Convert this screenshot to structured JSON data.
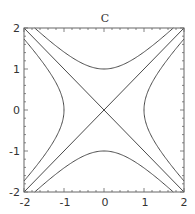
{
  "chart_data": {
    "type": "line",
    "subtype": "contour",
    "title": "C",
    "xlabel": "",
    "ylabel": "",
    "xlim": [
      -2,
      2
    ],
    "ylim": [
      -2,
      2
    ],
    "xticks": [
      -2,
      -1,
      0,
      1,
      2
    ],
    "yticks": [
      -2,
      -1,
      0,
      1,
      2
    ],
    "xtick_labels": [
      "-2",
      "-1",
      "0",
      "1",
      "2"
    ],
    "ytick_labels": [
      "-2",
      "-1",
      "0",
      "1",
      "2"
    ],
    "grid": false,
    "legend": null,
    "function": "x^2 - y^2",
    "contour_levels": [
      -1,
      0,
      1
    ],
    "series": [
      {
        "name": "x^2 - y^2 = 1 (right branch)",
        "points": [
          [
            1,
            0
          ],
          [
            1.25,
            0.75
          ],
          [
            1.5,
            1.118
          ],
          [
            1.75,
            1.436
          ],
          [
            2,
            1.732
          ],
          [
            1.25,
            -0.75
          ],
          [
            1.5,
            -1.118
          ],
          [
            1.75,
            -1.436
          ],
          [
            2,
            -1.732
          ]
        ]
      },
      {
        "name": "x^2 - y^2 = 1 (left branch)",
        "points": [
          [
            -1,
            0
          ],
          [
            -1.25,
            0.75
          ],
          [
            -1.5,
            1.118
          ],
          [
            -1.75,
            1.436
          ],
          [
            -2,
            1.732
          ],
          [
            -1.25,
            -0.75
          ],
          [
            -1.5,
            -1.118
          ],
          [
            -1.75,
            -1.436
          ],
          [
            -2,
            -1.732
          ]
        ]
      },
      {
        "name": "x^2 - y^2 = -1 (upper branch)",
        "points": [
          [
            0,
            1
          ],
          [
            0.75,
            1.25
          ],
          [
            1.118,
            1.5
          ],
          [
            1.436,
            1.75
          ],
          [
            1.732,
            2
          ],
          [
            -0.75,
            1.25
          ],
          [
            -1.118,
            1.5
          ],
          [
            -1.436,
            1.75
          ],
          [
            -1.732,
            2
          ]
        ]
      },
      {
        "name": "x^2 - y^2 = -1 (lower branch)",
        "points": [
          [
            0,
            -1
          ],
          [
            0.75,
            -1.25
          ],
          [
            1.118,
            -1.5
          ],
          [
            1.436,
            -1.75
          ],
          [
            1.732,
            -2
          ],
          [
            -0.75,
            -1.25
          ],
          [
            -1.118,
            -1.5
          ],
          [
            -1.436,
            -1.75
          ],
          [
            -1.732,
            -2
          ]
        ]
      },
      {
        "name": "x^2 - y^2 = 0 (y = x)",
        "points": [
          [
            -2,
            -2
          ],
          [
            2,
            2
          ]
        ]
      },
      {
        "name": "x^2 - y^2 = 0 (y = -x)",
        "points": [
          [
            -2,
            2
          ],
          [
            2,
            -2
          ]
        ]
      }
    ],
    "colors": {
      "line": "#4a4a4a",
      "frame": "#666666",
      "text": "#333333",
      "background": "#ffffff"
    }
  }
}
